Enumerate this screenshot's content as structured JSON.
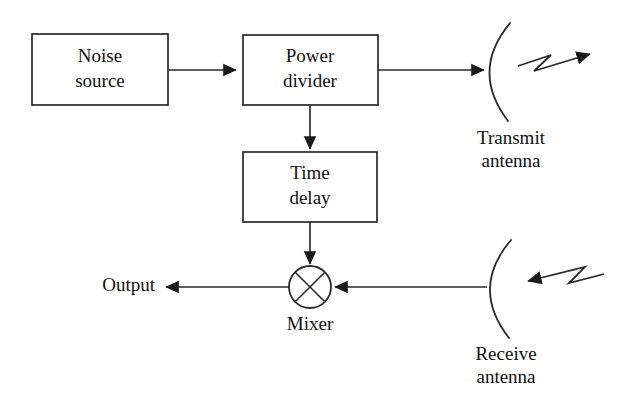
{
  "diagram": {
    "type": "block-diagram",
    "background_color": "#ffffff",
    "line_color": "#2a2a2a",
    "text_color": "#111111",
    "blocks": [
      {
        "id": "noise-source",
        "label_line1": "Noise",
        "label_line2": "source",
        "shape": "rectangle"
      },
      {
        "id": "power-divider",
        "label_line1": "Power",
        "label_line2": "divider",
        "shape": "rectangle"
      },
      {
        "id": "time-delay",
        "label_line1": "Time",
        "label_line2": "delay",
        "shape": "rectangle"
      }
    ],
    "mixer": {
      "label": "Mixer",
      "shape": "circle-with-x"
    },
    "antennas": [
      {
        "id": "transmit-antenna",
        "label_line1": "Transmit",
        "label_line2": "antenna",
        "direction": "transmit"
      },
      {
        "id": "receive-antenna",
        "label_line1": "Receive",
        "label_line2": "antenna",
        "direction": "receive"
      }
    ],
    "output": {
      "label": "Output"
    },
    "connections": [
      {
        "from": "noise-source",
        "to": "power-divider",
        "arrow": true
      },
      {
        "from": "power-divider",
        "to": "transmit-antenna",
        "arrow": true
      },
      {
        "from": "power-divider",
        "to": "time-delay",
        "arrow": true
      },
      {
        "from": "time-delay",
        "to": "mixer",
        "arrow": true
      },
      {
        "from": "receive-antenna",
        "to": "mixer",
        "arrow": true
      },
      {
        "from": "mixer",
        "to": "output",
        "arrow": true
      }
    ],
    "waves": [
      {
        "id": "transmit-wave",
        "direction": "outgoing-right"
      },
      {
        "id": "receive-wave",
        "direction": "incoming-left"
      }
    ]
  }
}
